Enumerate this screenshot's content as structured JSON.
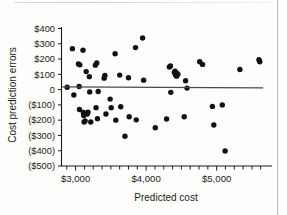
{
  "chart_data": {
    "type": "scatter",
    "title": "",
    "xlabel": "Predicted cost",
    "ylabel": "Cost prediction errors",
    "xlim": [
      2800,
      5700
    ],
    "ylim": [
      -500,
      400
    ],
    "grid": false,
    "legend": null,
    "x_tick_labels": [
      "$3,000",
      "$4,000",
      "$5,000"
    ],
    "x_tick_values": [
      3000,
      4000,
      5000
    ],
    "x_minor_tick_values": [
      2875,
      3125,
      3250,
      3375,
      3500,
      3625,
      3750,
      3875,
      4125,
      4250,
      4375,
      4500,
      4625,
      4750,
      4875,
      5125,
      5250,
      5375,
      5500,
      5625
    ],
    "y_tick_labels": [
      "$400",
      "$300",
      "$200",
      "$100",
      "0",
      "($100)",
      "($200)",
      "($300)",
      "($400)",
      "($500)"
    ],
    "y_tick_values": [
      400,
      300,
      200,
      100,
      0,
      -100,
      -200,
      -300,
      -400,
      -500
    ],
    "reference_line": {
      "name": "zero-trend-line",
      "y_start": 18,
      "y_end": 12,
      "x_start": 2800,
      "x_end": 5660
    },
    "marker_color": "#111111",
    "points": [
      [
        2880,
        15
      ],
      [
        2955,
        268
      ],
      [
        2975,
        -35
      ],
      [
        3040,
        168
      ],
      [
        3050,
        20
      ],
      [
        3055,
        -130
      ],
      [
        3060,
        162
      ],
      [
        3105,
        258
      ],
      [
        3110,
        -150
      ],
      [
        3115,
        -170
      ],
      [
        3120,
        -212
      ],
      [
        3135,
        -205
      ],
      [
        3150,
        118
      ],
      [
        3165,
        -160
      ],
      [
        3175,
        -148
      ],
      [
        3195,
        85
      ],
      [
        3200,
        -15
      ],
      [
        3215,
        -212
      ],
      [
        3280,
        160
      ],
      [
        3290,
        -118
      ],
      [
        3300,
        175
      ],
      [
        3310,
        -190
      ],
      [
        3320,
        -12
      ],
      [
        3405,
        75
      ],
      [
        3415,
        92
      ],
      [
        3430,
        -160
      ],
      [
        3490,
        -62
      ],
      [
        3505,
        -118
      ],
      [
        3560,
        235
      ],
      [
        3570,
        -200
      ],
      [
        3625,
        95
      ],
      [
        3640,
        -112
      ],
      [
        3700,
        -305
      ],
      [
        3750,
        78
      ],
      [
        3760,
        -178
      ],
      [
        3850,
        275
      ],
      [
        3860,
        -198
      ],
      [
        3950,
        338
      ],
      [
        3965,
        62
      ],
      [
        4130,
        -250
      ],
      [
        4290,
        -192
      ],
      [
        4330,
        148
      ],
      [
        4345,
        155
      ],
      [
        4350,
        -18
      ],
      [
        4400,
        112
      ],
      [
        4410,
        120
      ],
      [
        4418,
        95
      ],
      [
        4425,
        100
      ],
      [
        4432,
        88
      ],
      [
        4440,
        105
      ],
      [
        4450,
        100
      ],
      [
        4540,
        -178
      ],
      [
        4560,
        58
      ],
      [
        4580,
        10
      ],
      [
        4760,
        182
      ],
      [
        4800,
        165
      ],
      [
        4940,
        -110
      ],
      [
        4960,
        -232
      ],
      [
        5080,
        -100
      ],
      [
        5120,
        -402
      ],
      [
        5330,
        132
      ],
      [
        5600,
        196
      ],
      [
        5612,
        182
      ]
    ]
  },
  "figure": {
    "marker_radius": 2.7
  }
}
